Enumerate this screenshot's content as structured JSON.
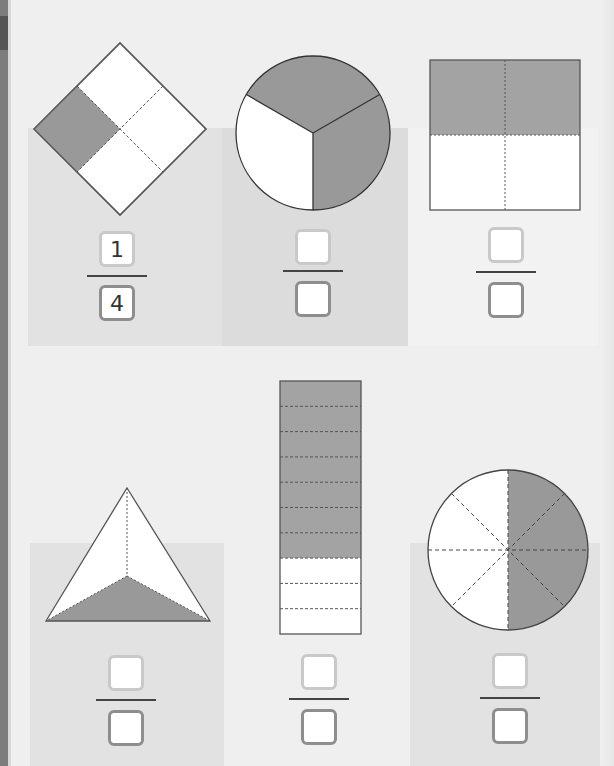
{
  "worksheet": {
    "topic": "fractions",
    "colors": {
      "shaded": "#9a9a9a",
      "unshaded": "#ffffff",
      "outline": "#555555",
      "page_bg": "#efefef",
      "panel_a": "#e2e2e2",
      "panel_b": "#dcdcdc"
    },
    "problems": [
      {
        "id": 1,
        "shape": "diamond (square rotated 45°)",
        "parts": 4,
        "shaded_parts": 1,
        "fraction": {
          "numerator": "1",
          "denominator": "4"
        }
      },
      {
        "id": 2,
        "shape": "circle",
        "parts": 3,
        "shaded_parts": 2,
        "fraction": {
          "numerator": "",
          "denominator": ""
        }
      },
      {
        "id": 3,
        "shape": "square",
        "parts": 4,
        "shaded_parts": 2,
        "fraction": {
          "numerator": "",
          "denominator": ""
        }
      },
      {
        "id": 4,
        "shape": "triangle",
        "parts": 3,
        "shaded_parts": 1,
        "fraction": {
          "numerator": "",
          "denominator": ""
        }
      },
      {
        "id": 5,
        "shape": "rectangle bar",
        "parts": 10,
        "shaded_parts": 7,
        "fraction": {
          "numerator": "",
          "denominator": ""
        }
      },
      {
        "id": 6,
        "shape": "circle",
        "parts": 8,
        "shaded_parts": 4,
        "fraction": {
          "numerator": "",
          "denominator": ""
        }
      }
    ]
  }
}
